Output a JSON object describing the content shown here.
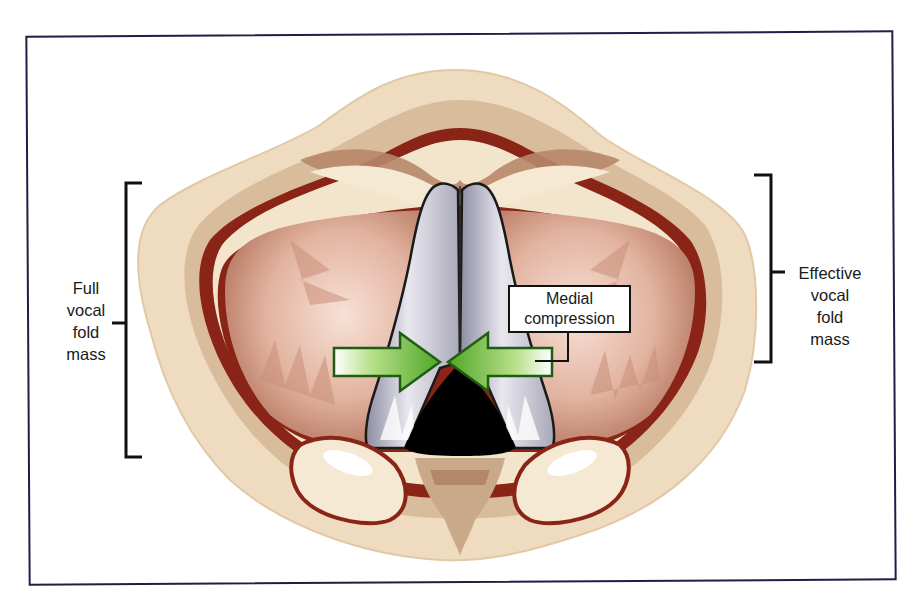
{
  "figure": {
    "frame_color": "#1c1f4a"
  },
  "labels": {
    "left": {
      "lines": [
        "Full",
        "vocal",
        "fold",
        "mass"
      ],
      "bracket_span_px": [
        183,
        457
      ]
    },
    "right": {
      "lines": [
        "Effective",
        "vocal",
        "fold",
        "mass"
      ],
      "bracket_span_px": [
        175,
        362
      ]
    },
    "callout": {
      "lines": [
        "Medial",
        "compression"
      ]
    }
  },
  "illustration": {
    "view": "superior view of larynx / glottis",
    "elements": [
      "vocal folds (grey-white)",
      "glottal gap (black, posterior)",
      "ventricular folds (pink)",
      "arytenoid region (cream)",
      "epiglottis (top)",
      "two green arrows pointing medially"
    ],
    "colors": {
      "tissue_cream": "#efdcc0",
      "tissue_tan": "#c9a98a",
      "tissue_dark_red": "#7a1a12",
      "ventricular_pink": "#d9a58f",
      "vocal_fold_grey": "#b9b8c6",
      "glottis_black": "#000000",
      "arrow_green": "#6bbf2a",
      "arrow_green_dark": "#1f5e12"
    }
  }
}
